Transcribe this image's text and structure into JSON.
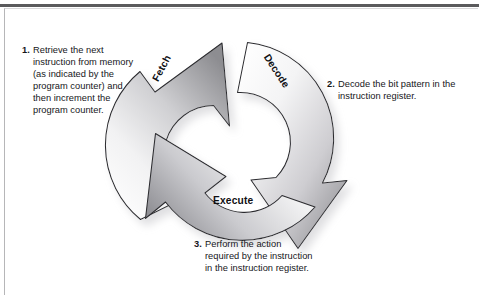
{
  "figure": {
    "type": "cycle-diagram",
    "steps": [
      {
        "number": "1.",
        "arrow_label": "Fetch",
        "text": "Retrieve the next instruction from memory (as indicated by the program counter) and then increment the program counter."
      },
      {
        "number": "2.",
        "arrow_label": "Decode",
        "text": "Decode the bit pattern in the instruction register."
      },
      {
        "number": "3.",
        "arrow_label": "Execute",
        "text": "Perform the action required by the instruction in the instruction register."
      }
    ]
  },
  "colors": {
    "rule": "#5a5a5c",
    "frame": "#b6b6b8",
    "text": "#16161a",
    "arrow_outline": "#2b2b2f",
    "arrow_light": "#fdfdfd",
    "arrow_dark": "#8e8e92",
    "shadow": "#b9b9bc"
  }
}
